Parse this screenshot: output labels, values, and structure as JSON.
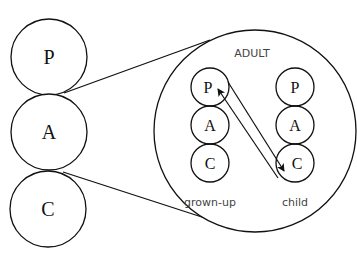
{
  "diagram": {
    "type": "transactional-analysis-ego-states",
    "left_stack": [
      {
        "label": "P",
        "cx": 49,
        "cy": 57,
        "r": 38
      },
      {
        "label": "A",
        "cx": 49,
        "cy": 132,
        "r": 38
      },
      {
        "label": "C",
        "cx": 48,
        "cy": 209,
        "r": 38
      }
    ],
    "magnified": {
      "title": "ADULT",
      "cx": 255,
      "cy": 131,
      "r": 101,
      "columns": [
        {
          "caption": "grown-up",
          "x": 210,
          "states": [
            {
              "label": "P",
              "cy": 87
            },
            {
              "label": "A",
              "cy": 125
            },
            {
              "label": "C",
              "cy": 163
            }
          ]
        },
        {
          "caption": "child",
          "x": 295,
          "states": [
            {
              "label": "P",
              "cy": 87
            },
            {
              "label": "A",
              "cy": 125
            },
            {
              "label": "C",
              "cy": 163
            }
          ]
        }
      ],
      "inner_r": 19
    },
    "arrows": [
      {
        "from": "grown-up P",
        "to": "child C"
      },
      {
        "from": "child C",
        "to": "grown-up P"
      }
    ]
  }
}
